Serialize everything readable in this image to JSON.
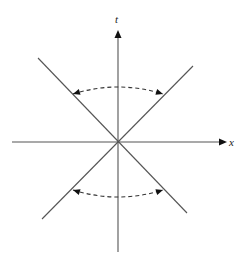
{
  "diagram": {
    "type": "spacetime-diagram",
    "origin": [
      118,
      142
    ],
    "axes": {
      "horizontal": {
        "label": "x",
        "from": [
          12,
          142
        ],
        "to": [
          227,
          142
        ],
        "label_pos": [
          229,
          146
        ]
      },
      "vertical": {
        "label": "t",
        "from": [
          118,
          252
        ],
        "to": [
          118,
          30
        ],
        "label_pos": [
          115,
          23
        ]
      }
    },
    "lines": [
      {
        "name": "line-nw-se",
        "from": [
          38,
          58
        ],
        "to": [
          187,
          213
        ]
      },
      {
        "name": "line-ne-sw",
        "from": [
          193,
          66
        ],
        "to": [
          42,
          219
        ]
      }
    ],
    "rotation_arcs": [
      {
        "name": "upper-arc",
        "from": [
          73,
          94
        ],
        "control": [
          118,
          80
        ],
        "to": [
          163,
          94
        ],
        "style": "dashed",
        "arrowheads": "both"
      },
      {
        "name": "lower-arc",
        "from": [
          73,
          190
        ],
        "control": [
          118,
          204
        ],
        "to": [
          163,
          190
        ],
        "style": "dashed",
        "arrowheads": "both"
      }
    ],
    "colors": {
      "lines": "#555555",
      "arrows": "#111111",
      "background": "#ffffff"
    }
  }
}
